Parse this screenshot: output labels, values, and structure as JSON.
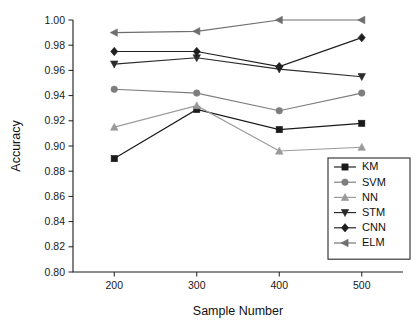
{
  "chart_data": {
    "type": "line",
    "title": "",
    "xlabel": "Sample Number",
    "ylabel": "Accuracy",
    "categories": [
      200,
      300,
      400,
      500
    ],
    "x": [
      200,
      300,
      400,
      500
    ],
    "xlim": [
      150,
      550
    ],
    "ylim": [
      0.8,
      1.0
    ],
    "xticks": [
      "200",
      "300",
      "400",
      "500"
    ],
    "yticks": [
      "0.80",
      "0.82",
      "0.84",
      "0.86",
      "0.88",
      "0.90",
      "0.92",
      "0.94",
      "0.96",
      "0.98",
      "1.00"
    ],
    "ytick_values": [
      0.8,
      0.82,
      0.84,
      0.86,
      0.88,
      0.9,
      0.92,
      0.94,
      0.96,
      0.98,
      1.0
    ],
    "grid": false,
    "legend_position": "bottom-right",
    "series": [
      {
        "name": "KM",
        "marker": "square",
        "color": "#1a1a1a",
        "values": [
          0.89,
          0.929,
          0.913,
          0.918
        ]
      },
      {
        "name": "SVM",
        "marker": "circle",
        "color": "#7d7d7d",
        "values": [
          0.945,
          0.942,
          0.928,
          0.942
        ]
      },
      {
        "name": "NN",
        "marker": "triangle-up",
        "color": "#9a9a9a",
        "values": [
          0.915,
          0.932,
          0.896,
          0.899
        ]
      },
      {
        "name": "STM",
        "marker": "triangle-down",
        "color": "#2b2b2b",
        "values": [
          0.965,
          0.97,
          0.961,
          0.955
        ]
      },
      {
        "name": "CNN",
        "marker": "diamond",
        "color": "#1f1f1f",
        "values": [
          0.975,
          0.975,
          0.963,
          0.986
        ]
      },
      {
        "name": "ELM",
        "marker": "triangle-left",
        "color": "#6e6e6e",
        "values": [
          0.99,
          0.991,
          1.0,
          1.0
        ]
      }
    ]
  },
  "legend": {
    "items": [
      {
        "label": "KM"
      },
      {
        "label": "SVM"
      },
      {
        "label": "NN"
      },
      {
        "label": "STM"
      },
      {
        "label": "CNN"
      },
      {
        "label": "ELM"
      }
    ]
  }
}
